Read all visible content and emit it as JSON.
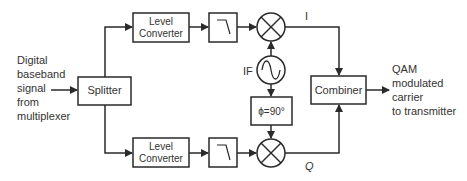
{
  "input_label": [
    "Digital",
    "baseband",
    "signal",
    "from",
    "multiplexer"
  ],
  "splitter_label": "Splitter",
  "level_converter_label": [
    "Level",
    "Converter"
  ],
  "if_label": "IF",
  "phase_label": "ϕ=90°",
  "combiner_label": "Combiner",
  "i_label": "I",
  "q_label": "Q",
  "output_label": [
    "QAM",
    "modulated",
    "carrier",
    "to transmitter"
  ],
  "colors": {
    "line": "#2a2a2a",
    "text": "#333333"
  }
}
